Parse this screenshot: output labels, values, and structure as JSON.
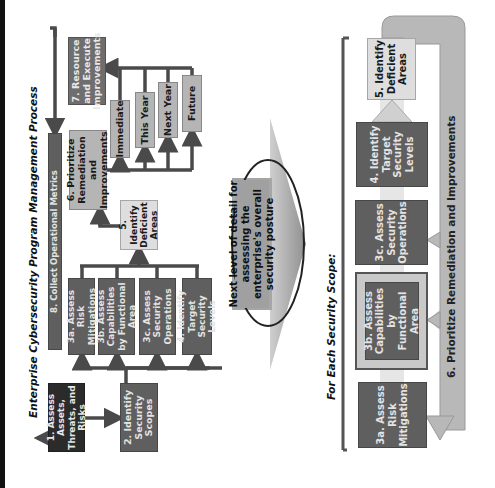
{
  "top_process": {
    "title": "Enterprise Cybersecurity Program Management Process",
    "steps": {
      "s1": "1. Assess Assets, Threats, and Risks",
      "s2": "2. Identify Security Scopes",
      "s3a": "3a. Assess Risk Mitigations",
      "s3b": "3b. Assess Capabilities by Functional Area",
      "s3c": "3c. Assess Security Operations",
      "s4": "4. Identify Target Security Levels",
      "s5": "5. Identify Deficient Areas",
      "s6": "6. Prioritize Remediation and Improvements",
      "s7": "7. Resource and Execute Improvements",
      "s8": "8. Collect Operational Metrics"
    },
    "priorities": [
      "Immediate",
      "This Year",
      "Next Year",
      "Future"
    ]
  },
  "transition": {
    "label": "Next level of detail for assessing the enterprise's overall security posture"
  },
  "scope_detail": {
    "title": "For Each Security Scope:",
    "steps": {
      "s3a": "3a. Assess Risk Mitigations",
      "s3b": "3b. Assess Capabilities by Functional Area",
      "s3c": "3c. Assess Security Operations",
      "s4": "4. Identify Target Security Levels",
      "s5": "5. Identify Deficient Areas"
    },
    "feedback_label": "6. Prioritize Remediation and Improvements"
  },
  "colors": {
    "dark": "#2b2b2b",
    "mid": "#5f5f5f",
    "light": "#b5b5b5",
    "pale": "#dedede",
    "connector": "#4a4a4a",
    "arrow_fill": "#b8b8b8"
  }
}
